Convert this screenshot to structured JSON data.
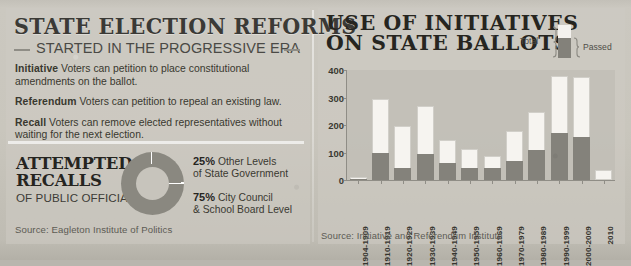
{
  "left": {
    "title": "STATE ELECTION REFORMS",
    "subtitle": "STARTED IN THE PROGRESSIVE ERA",
    "terms": [
      {
        "term": "Initiative",
        "definition": "Voters can petition to place constitutional amendments on the ballot."
      },
      {
        "term": "Referendum",
        "definition": "Voters can petition to repeal an existing law."
      },
      {
        "term": "Recall",
        "definition": "Voters can remove elected representatives without waiting for the next election."
      }
    ],
    "recall_heading_line1": "ATTEMPTED",
    "recall_heading_line2": "RECALLS",
    "recall_heading_line3": "OF PUBLIC OFFICIALS",
    "stats": [
      {
        "pct": "25%",
        "line1": "Other Levels",
        "line2": "of State Government"
      },
      {
        "pct": "75%",
        "line1": "City Council",
        "line2": "& School Board Level"
      }
    ],
    "source": "Source: Eagleton Institute of Politics"
  },
  "right": {
    "title_line1": "USE OF INITIATIVES",
    "title_line2": "ON STATE BALLOTS",
    "legend": {
      "total": "Total",
      "passed": "Passed"
    },
    "source": "Source: Initiative and Referendum Institute"
  },
  "chart_data": {
    "type": "bar",
    "title": "USE OF INITIATIVES ON STATE BALLOTS",
    "xlabel": "",
    "ylabel": "",
    "ylim": [
      0,
      400
    ],
    "yticks": [
      0,
      100,
      200,
      300,
      400
    ],
    "grid": false,
    "legend_position": "top-right",
    "categories": [
      "1904-1909",
      "1910-1919",
      "1920-1929",
      "1930-1939",
      "1940-1949",
      "1950-1959",
      "1960-1969",
      "1970-1979",
      "1980-1989",
      "1990-1999",
      "2000-2009",
      "2010"
    ],
    "series": [
      {
        "name": "Total",
        "values": [
          10,
          293,
          196,
          269,
          145,
          114,
          87,
          180,
          248,
          379,
          373,
          36
        ]
      },
      {
        "name": "Passed",
        "values": [
          3,
          100,
          45,
          96,
          62,
          42,
          42,
          68,
          110,
          171,
          157,
          0
        ]
      }
    ]
  },
  "colors": {
    "paper": "#c9c6bd",
    "ink": "#3a3932",
    "bar_total": "#f6f4f0",
    "bar_passed": "#84827b",
    "donut": "#8a8880"
  }
}
